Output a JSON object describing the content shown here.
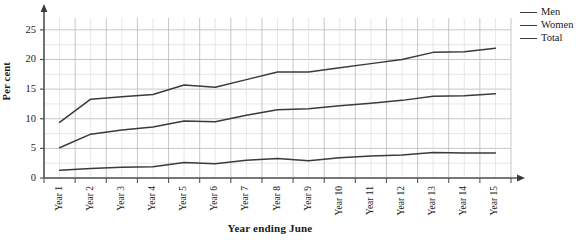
{
  "chart_data": {
    "type": "line",
    "title": "",
    "xlabel": "Year ending June",
    "ylabel": "Per cent",
    "grid": true,
    "legend_position": "top-right",
    "ylim": [
      0,
      27
    ],
    "y_ticks": [
      0,
      5,
      10,
      15,
      20,
      25
    ],
    "categories": [
      "Year 1",
      "Year 2",
      "Year 3",
      "Year 4",
      "Year 5",
      "Year 6",
      "Year 7",
      "Year 8",
      "Year 9",
      "Year 10",
      "Year 11",
      "Year 12",
      "Year 13",
      "Year 14",
      "Year 15"
    ],
    "series": [
      {
        "name": "Men",
        "color": "#3a3a3a",
        "values": [
          1.3,
          1.6,
          1.8,
          1.9,
          2.6,
          2.4,
          3.0,
          3.3,
          2.9,
          3.4,
          3.7,
          3.9,
          4.3,
          4.2,
          4.2
        ]
      },
      {
        "name": "Women",
        "color": "#3a3a3a",
        "values": [
          5.1,
          7.4,
          8.1,
          8.6,
          9.6,
          9.5,
          10.6,
          11.5,
          11.7,
          12.2,
          12.6,
          13.1,
          13.8,
          13.9,
          14.2
        ]
      },
      {
        "name": "Total",
        "color": "#3a3a3a",
        "values": [
          9.4,
          13.3,
          13.7,
          14.1,
          15.7,
          15.3,
          16.6,
          17.9,
          17.9,
          18.6,
          19.3,
          20.0,
          21.2,
          21.3,
          21.9
        ]
      }
    ]
  },
  "legend": {
    "items": [
      {
        "label": "Men"
      },
      {
        "label": "Women"
      },
      {
        "label": "Total"
      }
    ]
  },
  "axes": {
    "y_title": "Per cent",
    "x_title": "Year ending June"
  }
}
